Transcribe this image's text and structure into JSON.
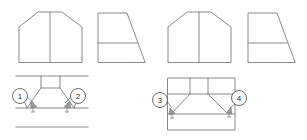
{
  "figure": {
    "background_color": "#ffffff",
    "line_color": "#7a7a7a",
    "width": 307,
    "height": 140
  },
  "callouts": [
    {
      "id": "callout-1",
      "label": "1",
      "cx": 20,
      "cy": 96,
      "r": 7.5,
      "group": "left"
    },
    {
      "id": "callout-2",
      "label": "2",
      "cx": 78,
      "cy": 96,
      "r": 7.5,
      "group": "left"
    },
    {
      "id": "callout-3",
      "label": "3",
      "cx": 160,
      "cy": 100,
      "r": 7.5,
      "group": "right"
    },
    {
      "id": "callout-4",
      "label": "4",
      "cx": 239,
      "cy": 98,
      "r": 7.5,
      "group": "right"
    }
  ],
  "views": [
    {
      "id": "left-front-view",
      "name": "left-group-front-view",
      "group": "left",
      "kind": "front-elevation",
      "outline": "M 19 62 L 19 27 L 38 12 L 62 12 L 82 27 L 82 62 Z",
      "details": [
        "M 50 12 L 50 62"
      ]
    },
    {
      "id": "left-side-view",
      "name": "left-group-side-view",
      "group": "left",
      "kind": "side-elevation",
      "outline": "M 98 62 L 98 13 L 127 13 L 145 62 Z",
      "details": [
        "M 98 43 L 137 43"
      ]
    },
    {
      "id": "left-plan-view",
      "name": "left-group-plan-view",
      "group": "left",
      "kind": "plan-section",
      "outline": "M 18 76 L 85 76 M 18 108 L 85 108 M 18 127 L 85 127",
      "details": [
        "M 41 76 L 41 88",
        "M 60 76 L 60 88",
        "M 41 88 L 28 108",
        "M 60 88 L 73 108",
        "M 41 88 L 60 88",
        "M 28 108 L 22 96",
        "M 73 108 L 79 96"
      ]
    },
    {
      "id": "right-front-view",
      "name": "right-group-front-view",
      "group": "right",
      "kind": "front-elevation",
      "outline": "M 168 62 L 168 27 L 187 12 L 211 12 L 231 27 L 231 62 Z",
      "details": [
        "M 199 12 L 199 62"
      ]
    },
    {
      "id": "right-side-view",
      "name": "right-group-side-view",
      "group": "right",
      "kind": "side-elevation",
      "outline": "M 248 62 L 248 13 L 277 13 L 295 62 Z",
      "details": [
        "M 248 43 L 287 43"
      ]
    },
    {
      "id": "right-plan-view",
      "name": "right-group-plan-view",
      "group": "right",
      "kind": "plan-section",
      "outline": "M 168 78 L 235 78 L 235 130 L 168 130 Z",
      "details": [
        "M 168 94 L 235 94",
        "M 168 114 L 235 114",
        "M 190 78 L 190 94",
        "M 208 78 L 208 94",
        "M 190 94 L 172 114",
        "M 208 94 L 228 114"
      ]
    }
  ],
  "dimension_arrows": [
    {
      "id": "arrow-1",
      "name": "chamfer-arrow-1",
      "x": 32,
      "y": 108
    },
    {
      "id": "arrow-2",
      "name": "chamfer-arrow-2",
      "x": 68,
      "y": 108
    },
    {
      "id": "arrow-3",
      "name": "chamfer-arrow-3",
      "x": 172,
      "y": 115
    },
    {
      "id": "arrow-4",
      "name": "chamfer-arrow-4",
      "x": 229,
      "y": 114
    }
  ]
}
